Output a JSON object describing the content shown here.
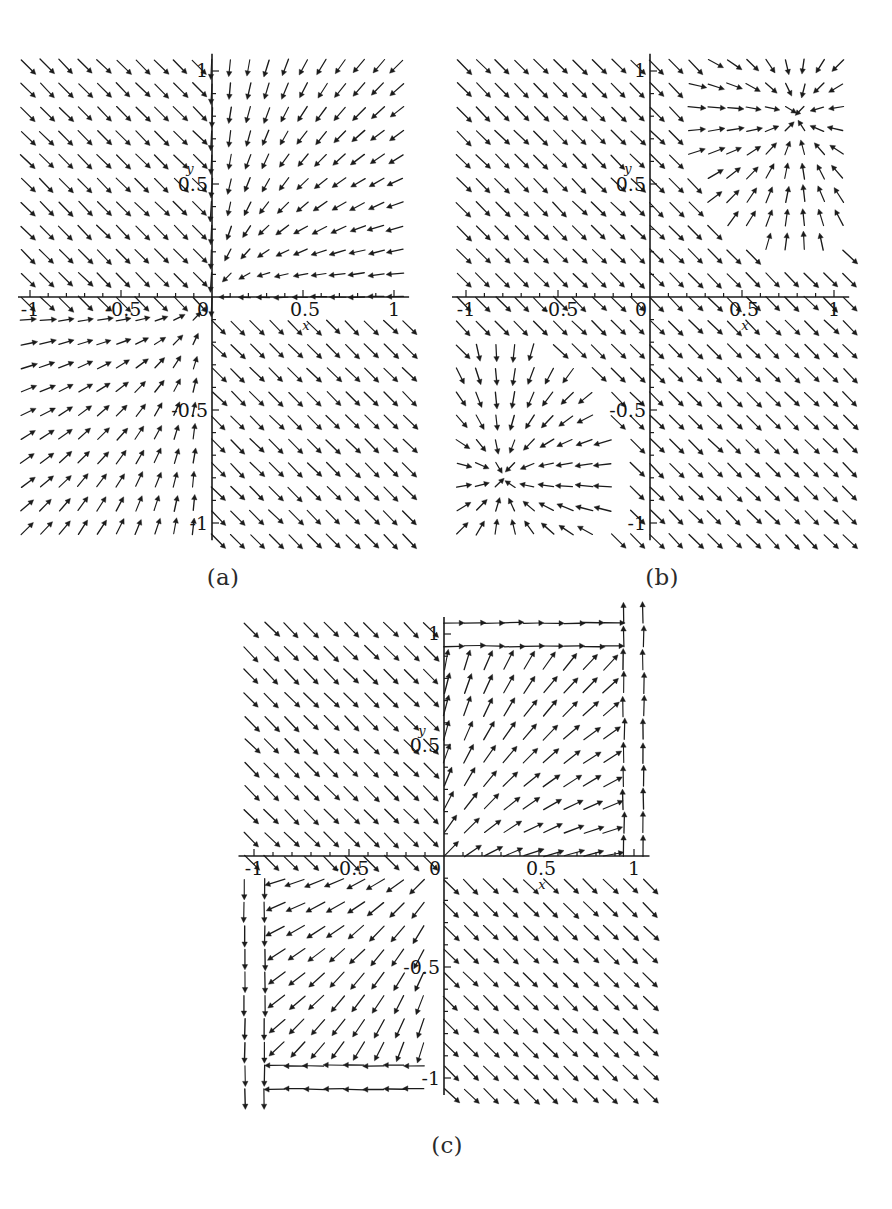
{
  "figure": {
    "kind": "phase-portrait-figure",
    "panel_count": 3,
    "background_color": "#ffffff",
    "ink_color": "#1b1b1b"
  },
  "panels": [
    {
      "id": "a",
      "caption": "(a)",
      "axis_labels": {
        "x": "x",
        "y": "y"
      },
      "x_ticks": [
        "-1",
        "-0.5",
        "0",
        "0.5",
        "1"
      ],
      "y_ticks": [
        "-1",
        "-0.5",
        "1",
        "0.5"
      ],
      "y_tick_top": "1",
      "y_tick_upper_mid": "0.5",
      "y_tick_lower_mid": "-0.5",
      "y_tick_bottom": "-1",
      "x_tick_left": "-1",
      "x_tick_left_mid": "-0.5",
      "x_tick_origin": "0",
      "x_tick_right_mid": "0.5",
      "x_tick_right": "1"
    },
    {
      "id": "b",
      "caption": "(b)",
      "axis_labels": {
        "x": "x",
        "y": "y"
      },
      "x_ticks": [
        "-1",
        "-0.5",
        "0",
        "0.5",
        "1"
      ],
      "y_ticks": [
        "-1",
        "-0.5",
        "1",
        "0.5"
      ],
      "y_tick_top": "1",
      "y_tick_upper_mid": "0.5",
      "y_tick_lower_mid": "-0.5",
      "y_tick_bottom": "-1",
      "x_tick_left": "-1",
      "x_tick_left_mid": "-0.5",
      "x_tick_origin": "0",
      "x_tick_right_mid": "0.5",
      "x_tick_right": "1"
    },
    {
      "id": "c",
      "caption": "(c)",
      "axis_labels": {
        "x": "x",
        "y": "y"
      },
      "x_ticks": [
        "-1",
        "-0.5",
        "0",
        "0.5",
        "1"
      ],
      "y_ticks": [
        "-1",
        "-0.5",
        "1",
        "0.5"
      ],
      "y_tick_top": "1",
      "y_tick_upper_mid": "0.5",
      "y_tick_lower_mid": "-0.5",
      "y_tick_bottom": "-1",
      "x_tick_left": "-1",
      "x_tick_left_mid": "-0.5",
      "x_tick_origin": "0",
      "x_tick_right_mid": "0.5",
      "x_tick_right": "1"
    }
  ],
  "chart_data": [
    {
      "type": "scatter",
      "subtype": "vector-field",
      "panel": "a",
      "title": "(a)",
      "xlabel": "x",
      "ylabel": "y",
      "xlim": [
        -1.1,
        1.1
      ],
      "ylim": [
        -1.1,
        1.1
      ],
      "xticks": [
        -1,
        -0.5,
        0,
        0.5,
        1
      ],
      "yticks": [
        -1,
        -0.5,
        0.5,
        1
      ],
      "xtick_labels": [
        "-1",
        "-0.5",
        "0",
        "0.5",
        "1"
      ],
      "ytick_labels": [
        "-1",
        "-0.5",
        "0.5",
        "1"
      ],
      "grid": false,
      "legend": false,
      "grid_points": 21,
      "field": {
        "description": "piecewise sign-dependent linear field; arrows converge on origin from quadrant I and diverge through quadrant III",
        "u_expr": "-sign(x)*(abs(x)+0.15)",
        "v_expr": "-sign(y)*(abs(y)+0.15)*0.85 - 0.25*sign(x)"
      },
      "critical_points": [
        {
          "x": 0.0,
          "y": 0.0,
          "kind": "node"
        }
      ]
    },
    {
      "type": "scatter",
      "subtype": "vector-field",
      "panel": "b",
      "title": "(b)",
      "xlabel": "x",
      "ylabel": "y",
      "xlim": [
        -1.1,
        1.1
      ],
      "ylim": [
        -1.1,
        1.1
      ],
      "xticks": [
        -1,
        -0.5,
        0,
        0.5,
        1
      ],
      "yticks": [
        -1,
        -0.5,
        0.5,
        1
      ],
      "xtick_labels": [
        "-1",
        "-0.5",
        "0",
        "0.5",
        "1"
      ],
      "ytick_labels": [
        "-1",
        "-0.5",
        "0.5",
        "1"
      ],
      "grid": false,
      "legend": false,
      "grid_points": 21,
      "field": {
        "description": "two antisymmetric attracting nodes located near (0.8, 0.8) and (-0.8, -0.8); elsewhere uniform down-right drift",
        "u_expr": "mixed",
        "v_expr": "mixed"
      },
      "critical_points": [
        {
          "x": 0.8,
          "y": 0.8,
          "kind": "stable-node"
        },
        {
          "x": -0.8,
          "y": -0.8,
          "kind": "stable-node"
        }
      ]
    },
    {
      "type": "scatter",
      "subtype": "vector-field",
      "panel": "c",
      "title": "(c)",
      "xlabel": "x",
      "ylabel": "y",
      "xlim": [
        -1.1,
        1.1
      ],
      "ylim": [
        -1.1,
        1.1
      ],
      "xticks": [
        -1,
        -0.5,
        0,
        0.5,
        1
      ],
      "yticks": [
        -1,
        -0.5,
        0.5,
        1
      ],
      "xtick_labels": [
        "-1",
        "-0.5",
        "0",
        "0.5",
        "1"
      ],
      "ytick_labels": [
        "-1",
        "-0.5",
        "0.5",
        "1"
      ],
      "grid": false,
      "legend": false,
      "grid_points": 21,
      "field": {
        "description": "quadrant I flows out to the upper-right corner, quadrant III flows out to the lower-left corner; quadrants II and IV carry uniform diagonal drift",
        "u_expr": "sign(x)*0.9",
        "v_expr": "sign(x)*0.9"
      },
      "critical_points": [
        {
          "x": 0.0,
          "y": 0.0,
          "kind": "degenerate"
        }
      ]
    }
  ]
}
